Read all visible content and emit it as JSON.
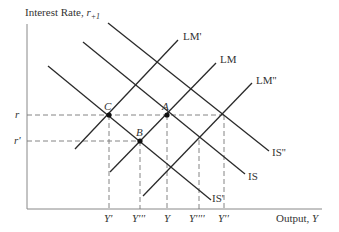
{
  "axes": {
    "y_label": "Interest Rate, ",
    "y_symbol": "r",
    "y_subscript": "+1",
    "x_label": "Output, ",
    "x_symbol": "Y"
  },
  "y_ticks": [
    {
      "label": "r",
      "y": 115
    },
    {
      "label": "r'",
      "y": 141
    }
  ],
  "x_ticks": [
    {
      "label": "Y'",
      "x": 109
    },
    {
      "label": "Y'''",
      "x": 140
    },
    {
      "label": "Y",
      "x": 167
    },
    {
      "label": "Y''''",
      "x": 199
    },
    {
      "label": "Y''",
      "x": 224
    }
  ],
  "curves": [
    {
      "name": "LM'",
      "label": "LM'",
      "x1": 75,
      "y1": 149,
      "x2": 178,
      "y2": 40
    },
    {
      "name": "LM",
      "label": "LM",
      "x1": 110,
      "y1": 172,
      "x2": 216,
      "y2": 63
    },
    {
      "name": "LM''",
      "label": "LM''",
      "x1": 143,
      "y1": 196,
      "x2": 252,
      "y2": 83
    },
    {
      "name": "IS'",
      "label": "IS'",
      "x1": 48,
      "y1": 66,
      "x2": 211,
      "y2": 200
    },
    {
      "name": "IS",
      "label": "IS",
      "x1": 83,
      "y1": 42,
      "x2": 245,
      "y2": 174
    },
    {
      "name": "IS''",
      "label": "IS''",
      "x1": 108,
      "y1": 23,
      "x2": 269,
      "y2": 151
    }
  ],
  "points": [
    {
      "label": "C",
      "x": 109,
      "y": 115
    },
    {
      "label": "A",
      "x": 167,
      "y": 115
    },
    {
      "label": "B",
      "x": 140,
      "y": 141
    }
  ],
  "colors": {
    "line": "#2a2a2a",
    "dash": "#777777",
    "axis": "#888888",
    "text": "#333333"
  }
}
